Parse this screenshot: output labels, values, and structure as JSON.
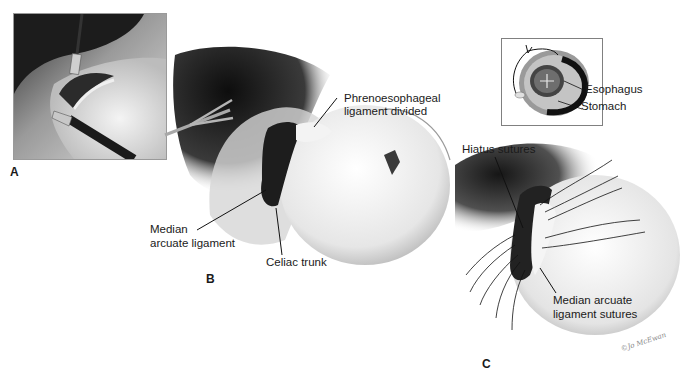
{
  "figure": {
    "panels": [
      {
        "id": "A",
        "letter": "A",
        "description": "Laparoscopic view with grasper and retractor at the hiatus"
      },
      {
        "id": "B",
        "letter": "B",
        "labels": {
          "phrenoesophageal_line1": "Phrenoesophageal",
          "phrenoesophageal_line2": "ligament divided",
          "median_line1": "Median",
          "median_line2": "arcuate ligament",
          "celiac": "Celiac trunk"
        }
      },
      {
        "id": "C",
        "letter": "C",
        "labels": {
          "hiatus": "Hiatus sutures",
          "median_sutures_line1": "Median arcuate",
          "median_sutures_line2": "ligament sutures"
        },
        "signature": "©Jo McEwan"
      }
    ],
    "inset": {
      "labels": {
        "esophagus": "Esophagus",
        "stomach": "Stomach"
      }
    }
  },
  "colors": {
    "background": "#ffffff",
    "dark_tissue": "#1e1e1e",
    "mid_gray": "#8c8c8c",
    "light_tissue": "#e6e6e6",
    "inset_ring_outer": "#9a9a9a",
    "inset_ring_dark": "#111111",
    "inset_border": "#777777",
    "label_text": "#1a1a1a"
  }
}
